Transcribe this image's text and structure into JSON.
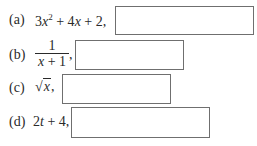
{
  "items": [
    {
      "label": "(a)",
      "expression_parts": [
        "3",
        "x",
        "2",
        " + 4",
        "x",
        " + 2,"
      ],
      "expression_text": "3x^2 + 4x + 2,",
      "answer": ""
    },
    {
      "label": "(b)",
      "numerator": "1",
      "denominator": "x + 1",
      "trail": ",",
      "expression_text": "1/(x+1),",
      "answer": ""
    },
    {
      "label": "(c)",
      "sqrt_symbol": "√",
      "radicand": "x",
      "trail": ",",
      "expression_text": "√x,",
      "answer": ""
    },
    {
      "label": "(d)",
      "expression_parts": [
        "2",
        "t",
        " + 4,"
      ],
      "expression_text": "2t + 4,",
      "answer": ""
    }
  ],
  "colors": {
    "text": "#2a2a2a",
    "box_border": "#6f6f6f",
    "background": "#ffffff"
  }
}
